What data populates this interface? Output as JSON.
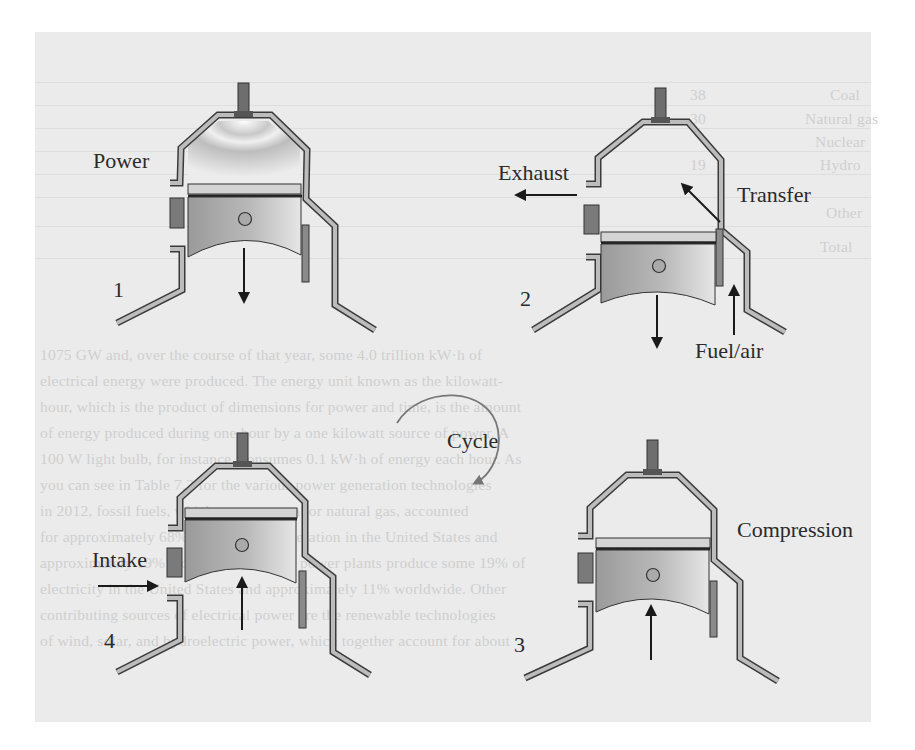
{
  "figure": {
    "stages": [
      {
        "number": "1",
        "name": "Power",
        "piston_motion": "down"
      },
      {
        "number": "2",
        "name": "Exhaust / Transfer",
        "piston_motion": "down",
        "labels": [
          "Exhaust",
          "Transfer",
          "Fuel/air"
        ]
      },
      {
        "number": "3",
        "name": "Compression",
        "piston_motion": "up"
      },
      {
        "number": "4",
        "name": "Intake",
        "piston_motion": "up"
      }
    ],
    "labels": {
      "power": "Power",
      "exhaust": "Exhaust",
      "transfer": "Transfer",
      "fuel_air": "Fuel/air",
      "intake": "Intake",
      "compression": "Compression",
      "cycle": "Cycle",
      "n1": "1",
      "n2": "2",
      "n3": "3",
      "n4": "4"
    },
    "colors": {
      "background_panel": "#ebebeb",
      "cylinder_wall_fill": "#b8b8b8",
      "cylinder_wall_stroke": "#3a3a3a",
      "piston_fill": "#a8a8a8",
      "port_block": "#7a7a7a",
      "arrow": "#1a1a1a",
      "cycle_arrow": "#777777"
    }
  },
  "background_text": {
    "table_rows": [
      "Coal",
      "Natural gas",
      "Nuclear",
      "Hydro",
      "Other",
      "Total"
    ],
    "table_values": [
      "38",
      "30",
      "19",
      "7",
      "6",
      "100"
    ],
    "paragraph_lines": [
      "1075 GW and, over the course of that year, some 4.0 trillion kW·h of",
      "electrical energy were produced. The energy unit known as the kilowatt-",
      "hour, which is the product of dimensions for power and time, is the amount",
      "of energy produced during one hour by a one kilowatt source of power. A",
      "100 W light bulb, for instance, consumes 0.1 kW·h of energy each hour. As",
      "you can see in Table 7.2 for the various power generation technologies",
      "in 2012, fossil fuels, which consume coal or natural gas, accounted",
      "for approximately 68% of all power generation in the United States and",
      "approximately 19% worldwide. Nuclear power plants produce some 19% of",
      "electricity in the United States and approximately 11% worldwide. Other",
      "contributing sources of electrical power are the renewable technologies",
      "of wind, solar, and hydroelectric power, which together account for about"
    ]
  }
}
